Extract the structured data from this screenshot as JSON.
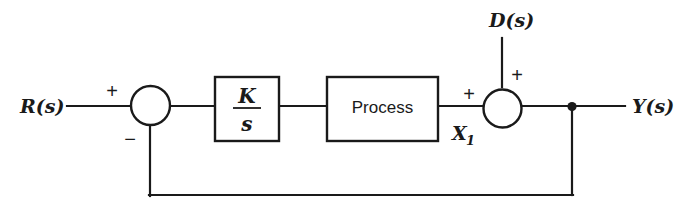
{
  "diagram": {
    "type": "control-system-block-diagram",
    "background_color": "#ffffff",
    "line_color": "#1a1a1a",
    "signals": {
      "reference_input": "R(s)",
      "disturbance_input": "D(s)",
      "output": "Y(s)",
      "intermediate": "X",
      "intermediate_subscript": "1"
    },
    "blocks": [
      {
        "id": "gain",
        "numerator": "K",
        "denominator": "s",
        "shape": "rectangle"
      },
      {
        "id": "process",
        "label": "Process",
        "shape": "rectangle"
      }
    ],
    "summing_junctions": [
      {
        "id": "error-junction",
        "signs": {
          "input_left": "+",
          "input_bottom": "−"
        }
      },
      {
        "id": "disturbance-junction",
        "signs": {
          "input_left": "+",
          "input_top": "+"
        }
      }
    ],
    "feedback": {
      "takeoff_label": "",
      "description": "unity feedback from output to error junction"
    }
  }
}
